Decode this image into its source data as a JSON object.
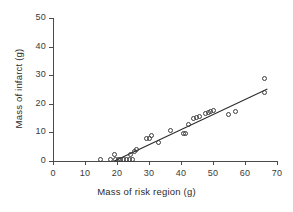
{
  "chart_data": {
    "type": "scatter",
    "title": "",
    "xlabel": "Mass of risk region (g)",
    "ylabel": "Mass of infarct (g)",
    "xlim": [
      0,
      70
    ],
    "ylim": [
      0,
      50
    ],
    "xticks": [
      0,
      10,
      20,
      30,
      40,
      50,
      60,
      70
    ],
    "yticks": [
      0,
      10,
      20,
      30,
      40,
      50
    ],
    "grid": false,
    "legend": null,
    "marker": "open-circle",
    "marker_color": "#3c3c3c",
    "line_color": "#2b2b2b",
    "points": [
      {
        "x": 15.0,
        "y": 0.2
      },
      {
        "x": 18.2,
        "y": 0.2
      },
      {
        "x": 19.3,
        "y": 2.2
      },
      {
        "x": 19.6,
        "y": 0.3
      },
      {
        "x": 20.6,
        "y": 0.2
      },
      {
        "x": 21.4,
        "y": 0.2
      },
      {
        "x": 22.3,
        "y": 0.3
      },
      {
        "x": 23.2,
        "y": 0.2
      },
      {
        "x": 24.0,
        "y": 0.2
      },
      {
        "x": 24.3,
        "y": 2.0
      },
      {
        "x": 24.9,
        "y": 0.2
      },
      {
        "x": 25.6,
        "y": 3.2
      },
      {
        "x": 26.1,
        "y": 3.8
      },
      {
        "x": 29.3,
        "y": 7.6
      },
      {
        "x": 30.2,
        "y": 7.7
      },
      {
        "x": 30.8,
        "y": 8.8
      },
      {
        "x": 33.0,
        "y": 6.4
      },
      {
        "x": 37.0,
        "y": 10.6
      },
      {
        "x": 40.8,
        "y": 9.6
      },
      {
        "x": 41.5,
        "y": 9.3
      },
      {
        "x": 42.4,
        "y": 12.7
      },
      {
        "x": 44.2,
        "y": 14.7
      },
      {
        "x": 44.9,
        "y": 14.9
      },
      {
        "x": 45.8,
        "y": 15.4
      },
      {
        "x": 47.8,
        "y": 16.4
      },
      {
        "x": 48.6,
        "y": 16.8
      },
      {
        "x": 49.3,
        "y": 17.2
      },
      {
        "x": 50.3,
        "y": 17.5
      },
      {
        "x": 55.0,
        "y": 16.2
      },
      {
        "x": 57.2,
        "y": 17.0
      },
      {
        "x": 66.2,
        "y": 28.5
      },
      {
        "x": 66.4,
        "y": 23.8
      }
    ],
    "fit_line": {
      "x_start": 19.2,
      "y_start": 0.0,
      "x_end": 67.0,
      "y_end": 25.2
    }
  }
}
